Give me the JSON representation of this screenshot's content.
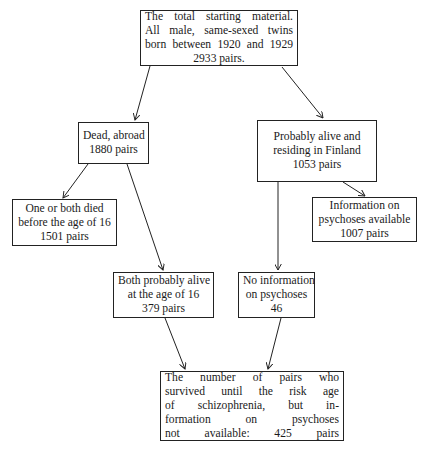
{
  "diagram": {
    "type": "flowchart",
    "nodes": [
      {
        "id": "total",
        "lines": [
          "The total starting material.",
          "All male, same-sexed twins",
          "born between 1920 and 1929",
          "2933 pairs."
        ]
      },
      {
        "id": "dead_abroad",
        "lines": [
          "Dead, abroad",
          "1880 pairs"
        ]
      },
      {
        "id": "alive_finland",
        "lines": [
          "Probably alive and",
          "residing in Finland",
          "1053 pairs"
        ]
      },
      {
        "id": "died_before_16",
        "lines": [
          "One or both died",
          "before the age of 16",
          "1501 pairs"
        ]
      },
      {
        "id": "info_available",
        "lines": [
          "Information on",
          "psychoses available",
          "1007 pairs"
        ]
      },
      {
        "id": "alive_at_16",
        "lines": [
          "Both probably alive",
          "at the age of 16",
          "379 pairs"
        ]
      },
      {
        "id": "no_info",
        "lines": [
          "No information",
          "on psychoses",
          "46"
        ]
      },
      {
        "id": "not_available",
        "lines": [
          "The number of pairs who",
          "survived until the risk age",
          "of schizophrenia, but in-",
          "formation on psychoses",
          "not available: 425 pairs"
        ]
      }
    ],
    "edges": [
      {
        "from": "total",
        "to": "dead_abroad"
      },
      {
        "from": "total",
        "to": "alive_finland"
      },
      {
        "from": "dead_abroad",
        "to": "died_before_16"
      },
      {
        "from": "dead_abroad",
        "to": "alive_at_16"
      },
      {
        "from": "alive_finland",
        "to": "info_available"
      },
      {
        "from": "alive_finland",
        "to": "no_info"
      },
      {
        "from": "alive_at_16",
        "to": "not_available"
      },
      {
        "from": "no_info",
        "to": "not_available"
      }
    ]
  }
}
